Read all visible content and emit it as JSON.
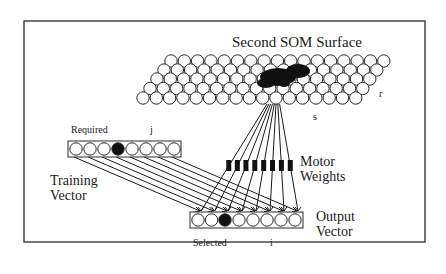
{
  "diagram": {
    "title": "Second SOM Surface",
    "labels": {
      "r": "r",
      "s": "s",
      "required": "Required",
      "j": "j",
      "training_vector_line1": "Training",
      "training_vector_line2": "Vector",
      "motor_weights_line1": "Motor",
      "motor_weights_line2": "Weights",
      "output_vector_line1": "Output",
      "output_vector_line2": "Vector",
      "selected": "Selected",
      "i": "i"
    },
    "som_grid": {
      "rows": 5,
      "active_region": "dark cluster of filled nodes near upper-middle of surface",
      "selected_node": "s"
    },
    "training_vector": {
      "nodes": 8,
      "active_index": 3
    },
    "output_vector": {
      "nodes": 8,
      "active_index": 2
    },
    "motor_weights": {
      "count": 8
    },
    "colors": {
      "ink": "#1a1a1a",
      "background": "#ffffff",
      "frame": "#2a2a2a"
    }
  }
}
